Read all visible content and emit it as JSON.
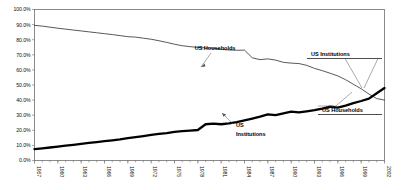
{
  "chart_data": {
    "type": "line",
    "title": "",
    "xlabel": "",
    "ylabel": "",
    "ylim": [
      0,
      100
    ],
    "xlim": [
      1957,
      2002
    ],
    "grid": false,
    "legend_position": "inline-annotations",
    "ytick_labels": [
      "0.0%",
      "10.0%",
      "20.0%",
      "30.0%",
      "40.0%",
      "50.0%",
      "60.0%",
      "70.0%",
      "80.0%",
      "90.0%",
      "100.0%"
    ],
    "ytick_values": [
      0,
      10,
      20,
      30,
      40,
      50,
      60,
      70,
      80,
      90,
      100
    ],
    "xtick_labels": [
      "1957",
      "1960",
      "1963",
      "1966",
      "1969",
      "1972",
      "1975",
      "1978",
      "1981",
      "1984",
      "1987",
      "1990",
      "1993",
      "1996",
      "1999",
      "2002"
    ],
    "xtick_values": [
      1957,
      1960,
      1963,
      1966,
      1969,
      1972,
      1975,
      1978,
      1981,
      1984,
      1987,
      1990,
      1993,
      1996,
      1999,
      2002
    ],
    "x": [
      1957,
      1958,
      1959,
      1960,
      1961,
      1962,
      1963,
      1964,
      1965,
      1966,
      1967,
      1968,
      1969,
      1970,
      1971,
      1972,
      1973,
      1974,
      1975,
      1976,
      1977,
      1978,
      1979,
      1980,
      1981,
      1982,
      1983,
      1984,
      1985,
      1986,
      1987,
      1988,
      1989,
      1990,
      1991,
      1992,
      1993,
      1994,
      1995,
      1996,
      1997,
      1998,
      1999,
      2000,
      2001,
      2002
    ],
    "series": [
      {
        "name": "US Households",
        "style": "thin-line",
        "values": [
          89.5,
          89.0,
          88.3,
          87.6,
          87.0,
          86.4,
          85.8,
          85.2,
          84.6,
          84.0,
          83.4,
          82.7,
          82.0,
          81.7,
          81.0,
          80.3,
          79.3,
          78.2,
          77.0,
          76.0,
          75.4,
          74.9,
          74.6,
          74.4,
          73.6,
          73.2,
          73.0,
          73.1,
          68.0,
          66.8,
          67.3,
          66.5,
          65.0,
          64.5,
          64.2,
          63.0,
          61.0,
          59.5,
          57.8,
          56.0,
          53.5,
          50.5,
          47.5,
          44.0,
          41.0,
          40.0
        ]
      },
      {
        "name": "US Institutions",
        "style": "thick-line",
        "values": [
          7.5,
          8.0,
          8.6,
          9.2,
          9.8,
          10.4,
          11.0,
          11.6,
          12.2,
          12.8,
          13.4,
          14.0,
          14.8,
          15.5,
          16.2,
          17.0,
          17.6,
          18.2,
          19.0,
          19.4,
          19.8,
          20.2,
          24.0,
          24.4,
          24.0,
          24.6,
          25.4,
          26.6,
          27.8,
          29.0,
          30.5,
          30.0,
          31.2,
          32.4,
          31.8,
          32.6,
          33.4,
          34.4,
          35.6,
          35.0,
          36.4,
          38.0,
          39.4,
          41.0,
          44.5,
          48.0
        ]
      }
    ],
    "annotations": [
      {
        "text": "US Households",
        "kind": "inline",
        "points_to_series": "US Households"
      },
      {
        "text": "US\nInstitutions",
        "kind": "inline",
        "points_to_series": "US Institutions"
      },
      {
        "text": "US  Institutions",
        "kind": "callout",
        "points_to_series": "US Institutions"
      },
      {
        "text": "US Households",
        "kind": "callout",
        "points_to_series": "US Households"
      }
    ]
  },
  "annot": {
    "households_inline": "US Households",
    "institutions_inline_1": "US",
    "institutions_inline_2": "Institutions",
    "institutions_callout": "US  Institutions",
    "households_callout": "US Households"
  }
}
